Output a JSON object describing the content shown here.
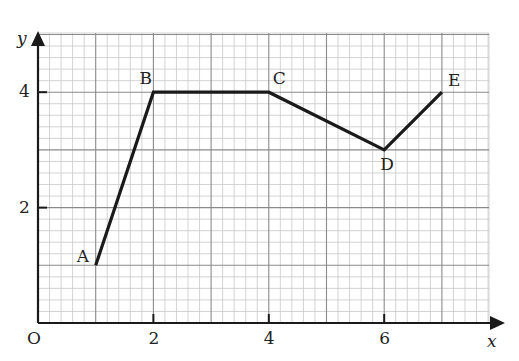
{
  "chart_data": {
    "type": "line",
    "title": "",
    "xlabel": "x",
    "ylabel": "y",
    "origin_label": "O",
    "xlim": [
      0,
      7.8
    ],
    "ylim": [
      0,
      5.1
    ],
    "x_ticks": [
      2,
      4,
      6
    ],
    "x_tick_labels": [
      "2",
      "4",
      "6"
    ],
    "y_ticks": [
      2,
      4
    ],
    "y_tick_labels": [
      "2",
      "4"
    ],
    "grid": true,
    "grid_minor_step": 0.2,
    "grid_major_step": 1,
    "series": [
      {
        "name": "ABCDE",
        "points": [
          {
            "label": "A",
            "x": 1,
            "y": 1
          },
          {
            "label": "B",
            "x": 2,
            "y": 4
          },
          {
            "label": "C",
            "x": 4,
            "y": 4
          },
          {
            "label": "D",
            "x": 6,
            "y": 3
          },
          {
            "label": "E",
            "x": 7,
            "y": 4
          }
        ]
      }
    ],
    "colors": {
      "line": "#1a1a1a",
      "grid_minor": "#c8c8c8",
      "grid_major": "#8a8a8a",
      "axis": "#1a1a1a"
    }
  }
}
